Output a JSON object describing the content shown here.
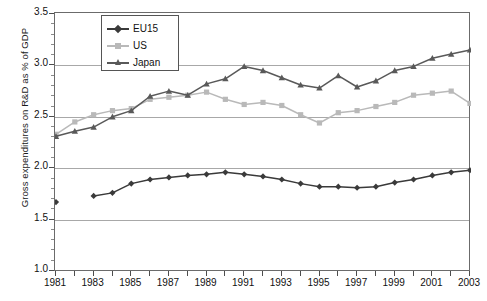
{
  "axes": {
    "ylabel": "Gross expenditures on R&D as % of GDP",
    "yticks": [
      "1.0",
      "1.5",
      "2.0",
      "2.5",
      "3.0",
      "3.5"
    ],
    "xticks": [
      "1981",
      "1983",
      "1985",
      "1987",
      "1989",
      "1991",
      "1993",
      "1995",
      "1997",
      "1999",
      "2001",
      "2003"
    ],
    "ylim": [
      1.0,
      3.5
    ],
    "xlim": [
      1981,
      2003
    ]
  },
  "legend": {
    "position": "top-left-inside",
    "items": [
      {
        "label": "EU15",
        "color": "#3a3a3a",
        "marker": "diamond"
      },
      {
        "label": "US",
        "color": "#b9b9b9",
        "marker": "square"
      },
      {
        "label": "Japan",
        "color": "#595959",
        "marker": "triangle"
      }
    ]
  },
  "colors": {
    "eu15": "#3a3a3a",
    "us": "#b9b9b9",
    "japan": "#595959",
    "grid": "#a8a8a8",
    "frame": "#6b6b6b",
    "text": "#111111"
  },
  "chart_data": {
    "type": "line",
    "title": "",
    "xlabel": "",
    "ylabel": "Gross expenditures on R&D as % of GDP",
    "xlim": [
      1981,
      2003
    ],
    "ylim": [
      1.0,
      3.5
    ],
    "grid": true,
    "legend_position": "upper left",
    "x": [
      1981,
      1982,
      1983,
      1984,
      1985,
      1986,
      1987,
      1988,
      1989,
      1990,
      1991,
      1992,
      1993,
      1994,
      1995,
      1996,
      1997,
      1998,
      1999,
      2000,
      2001,
      2002,
      2003
    ],
    "series": [
      {
        "name": "EU15",
        "marker": "diamond",
        "color": "#3a3a3a",
        "values": [
          1.67,
          null,
          1.73,
          1.76,
          1.85,
          1.89,
          1.91,
          1.93,
          1.94,
          1.96,
          1.94,
          1.92,
          1.89,
          1.85,
          1.82,
          1.82,
          1.81,
          1.82,
          1.86,
          1.89,
          1.93,
          1.96,
          1.98
        ]
      },
      {
        "name": "US",
        "marker": "square",
        "color": "#b9b9b9",
        "values": [
          2.33,
          2.45,
          2.52,
          2.56,
          2.58,
          2.67,
          2.69,
          2.71,
          2.74,
          2.67,
          2.62,
          2.64,
          2.61,
          2.52,
          2.44,
          2.54,
          2.56,
          2.6,
          2.64,
          2.71,
          2.73,
          2.75,
          2.63
        ]
      },
      {
        "name": "Japan",
        "marker": "triangle",
        "color": "#595959",
        "values": [
          2.31,
          2.36,
          2.4,
          2.5,
          2.56,
          2.7,
          2.75,
          2.71,
          2.82,
          2.87,
          2.99,
          2.95,
          2.88,
          2.81,
          2.78,
          2.9,
          2.79,
          2.85,
          2.95,
          2.99,
          3.07,
          3.11,
          3.15
        ]
      }
    ]
  }
}
